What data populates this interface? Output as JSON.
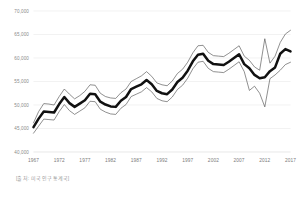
{
  "chart_data": {
    "type": "line",
    "title": "",
    "subtitle": "",
    "xlabel": "",
    "ylabel": "",
    "xlim": [
      1967,
      2017
    ],
    "ylim": [
      40000,
      70000
    ],
    "grid": true,
    "legend": false,
    "legend_position": "none",
    "y_ticks": [
      70000,
      65000,
      60000,
      55000,
      50000,
      45000,
      40000
    ],
    "y_tick_labels": [
      "70,000",
      "65,000",
      "60,000",
      "55,000",
      "50,000",
      "45,000",
      "40,000"
    ],
    "x_ticks": [
      1967,
      1972,
      1977,
      1982,
      1987,
      1992,
      1997,
      2002,
      2007,
      2012,
      2017
    ],
    "x_tick_labels": [
      "1967",
      "1972",
      "1977",
      "1982",
      "1987",
      "1992",
      "1997",
      "2002",
      "2007",
      "2012",
      "2017"
    ],
    "x": [
      1967,
      1968,
      1969,
      1970,
      1971,
      1972,
      1973,
      1974,
      1975,
      1976,
      1977,
      1978,
      1979,
      1980,
      1981,
      1982,
      1983,
      1984,
      1985,
      1986,
      1987,
      1988,
      1989,
      1990,
      1991,
      1992,
      1993,
      1994,
      1995,
      1996,
      1997,
      1998,
      1999,
      2000,
      2001,
      2002,
      2003,
      2004,
      2005,
      2006,
      2007,
      2008,
      2009,
      2010,
      2011,
      2012,
      2013,
      2014,
      2015,
      2016,
      2017
    ],
    "series": [
      {
        "name": "Upper bound",
        "style": "thin",
        "color": "#4a4a4a",
        "values": [
          46200,
          48600,
          50300,
          50200,
          50000,
          51800,
          53400,
          52300,
          51300,
          52000,
          52900,
          54300,
          54200,
          52500,
          51800,
          51500,
          51400,
          52600,
          53400,
          55000,
          55600,
          56200,
          57100,
          56100,
          54700,
          54300,
          54100,
          55100,
          56700,
          57600,
          59100,
          61100,
          62600,
          62700,
          61200,
          60500,
          60400,
          60300,
          61000,
          61800,
          62600,
          60400,
          59500,
          58100,
          57400,
          64100,
          58900,
          60400,
          63300,
          65100,
          65900
        ]
      },
      {
        "name": "Median household income",
        "style": "thick",
        "color": "#111111",
        "values": [
          45300,
          47100,
          48600,
          48500,
          48400,
          50200,
          51700,
          50400,
          49600,
          50300,
          51000,
          52400,
          52300,
          50700,
          50100,
          49700,
          49600,
          50900,
          51700,
          53400,
          53900,
          54400,
          55300,
          54400,
          53000,
          52500,
          52300,
          53300,
          54900,
          55800,
          57300,
          59300,
          60700,
          60900,
          59400,
          58700,
          58600,
          58500,
          59200,
          60000,
          60800,
          58700,
          57800,
          56400,
          55700,
          55900,
          57200,
          58000,
          60900,
          61900,
          61400
        ]
      },
      {
        "name": "Lower bound",
        "style": "thin",
        "color": "#4a4a4a",
        "values": [
          44000,
          45500,
          47000,
          46900,
          46800,
          48600,
          50100,
          48800,
          48000,
          48700,
          49400,
          50800,
          50700,
          49100,
          48500,
          48100,
          48000,
          49300,
          50100,
          51800,
          52300,
          52800,
          53700,
          52800,
          51400,
          50900,
          50700,
          51700,
          53300,
          54200,
          55700,
          57700,
          59100,
          59300,
          57800,
          57100,
          57000,
          56900,
          57600,
          58400,
          59200,
          57100,
          53100,
          54000,
          52500,
          49600,
          55600,
          56400,
          57400,
          58600,
          59100
        ]
      }
    ]
  },
  "caption": {
    "source_text": "[출처: 미국 인구통계국]"
  }
}
